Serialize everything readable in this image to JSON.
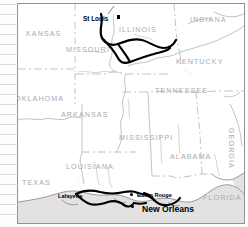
{
  "map": {
    "title": "Southern United States regional route map",
    "background_color": "#ffffff",
    "border_color": "#8e9194",
    "water_color": "#e2e2e2",
    "state_line_color": "#b9bdc0",
    "state_label_color": "#a7abaf",
    "route_color": "#000000",
    "margin_rule_color": "#d9dde0",
    "margin_rule_count": 22
  },
  "states": [
    {
      "name": "KANSAS",
      "x": 8,
      "y": 26,
      "rotated": false
    },
    {
      "name": "MISSOURI",
      "x": 48,
      "y": 42,
      "rotated": false
    },
    {
      "name": "ILLINOIS",
      "x": 101,
      "y": 22,
      "rotated": false
    },
    {
      "name": "INDIANA",
      "x": 172,
      "y": 12,
      "rotated": false
    },
    {
      "name": "KENTUCKY",
      "x": 158,
      "y": 54,
      "rotated": false
    },
    {
      "name": "OKLAHOMA",
      "x": -3,
      "y": 91,
      "rotated": false
    },
    {
      "name": "ARKANSAS",
      "x": 43,
      "y": 107,
      "rotated": false
    },
    {
      "name": "TENNESSEE",
      "x": 137,
      "y": 83,
      "rotated": false
    },
    {
      "name": "MISSISSIPPI",
      "x": 101,
      "y": 130,
      "rotated": false
    },
    {
      "name": "ALABAMA",
      "x": 152,
      "y": 149,
      "rotated": false
    },
    {
      "name": "GEORGIA",
      "x": 217,
      "y": 124,
      "rotated": true
    },
    {
      "name": "LOUISIANA",
      "x": 48,
      "y": 159,
      "rotated": false
    },
    {
      "name": "TEXAS",
      "x": 4,
      "y": 175,
      "rotated": false
    },
    {
      "name": "FLORIDA",
      "x": 185,
      "y": 190,
      "rotated": false
    }
  ],
  "cities": [
    {
      "name": "St Louis",
      "size": "md",
      "label_x": 65,
      "label_y": 12,
      "marker": "square",
      "marker_x": 99,
      "marker_y": 11
    },
    {
      "name": "Lafayette",
      "size": "sm",
      "label_x": 40,
      "label_y": 190,
      "marker": "none",
      "marker_x": 0,
      "marker_y": 0
    },
    {
      "name": "Baton Rouge",
      "size": "sm",
      "label_x": 119,
      "label_y": 189,
      "marker": "dot",
      "marker_x": 112,
      "marker_y": 189
    },
    {
      "name": "New Orleans",
      "size": "lg",
      "label_x": 124,
      "label_y": 201,
      "marker": "dot",
      "marker_x": 113,
      "marker_y": 201
    }
  ]
}
